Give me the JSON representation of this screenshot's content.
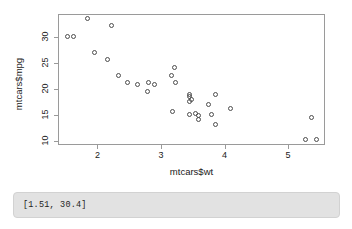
{
  "chart_data": {
    "type": "scatter",
    "title": "",
    "xlabel": "mtcars$wt",
    "ylabel": "mtcars$mpg",
    "xlim": [
      1.38,
      5.58
    ],
    "ylim": [
      9.2,
      34.5
    ],
    "xticks": [
      2,
      3,
      4,
      5
    ],
    "yticks": [
      10,
      15,
      20,
      25,
      30
    ],
    "xtick_labels": [
      "2",
      "3",
      "4",
      "5"
    ],
    "ytick_labels": [
      "10",
      "15",
      "20",
      "25",
      "30"
    ],
    "grid": false,
    "legend": false,
    "point_symbol": "open-circle",
    "point_color": "#4d4d4d",
    "series": [
      {
        "name": "mtcars",
        "x": [
          2.62,
          2.875,
          2.32,
          3.215,
          3.44,
          3.46,
          3.57,
          3.19,
          3.15,
          3.44,
          3.44,
          4.07,
          3.73,
          3.78,
          5.25,
          5.424,
          5.345,
          2.2,
          1.615,
          1.835,
          2.465,
          3.52,
          3.435,
          3.84,
          3.845,
          1.935,
          2.14,
          1.513,
          3.17,
          2.77,
          3.57,
          2.78
        ],
        "y": [
          21.0,
          21.0,
          22.8,
          21.4,
          18.7,
          18.1,
          14.3,
          24.4,
          22.8,
          19.2,
          17.8,
          16.4,
          17.3,
          15.2,
          10.4,
          10.4,
          14.7,
          32.4,
          30.4,
          33.9,
          21.5,
          15.5,
          15.2,
          13.3,
          19.2,
          27.3,
          26.0,
          30.4,
          15.8,
          19.7,
          15.0,
          21.4
        ]
      }
    ]
  },
  "status": {
    "text": "[1.51, 30.4]"
  }
}
